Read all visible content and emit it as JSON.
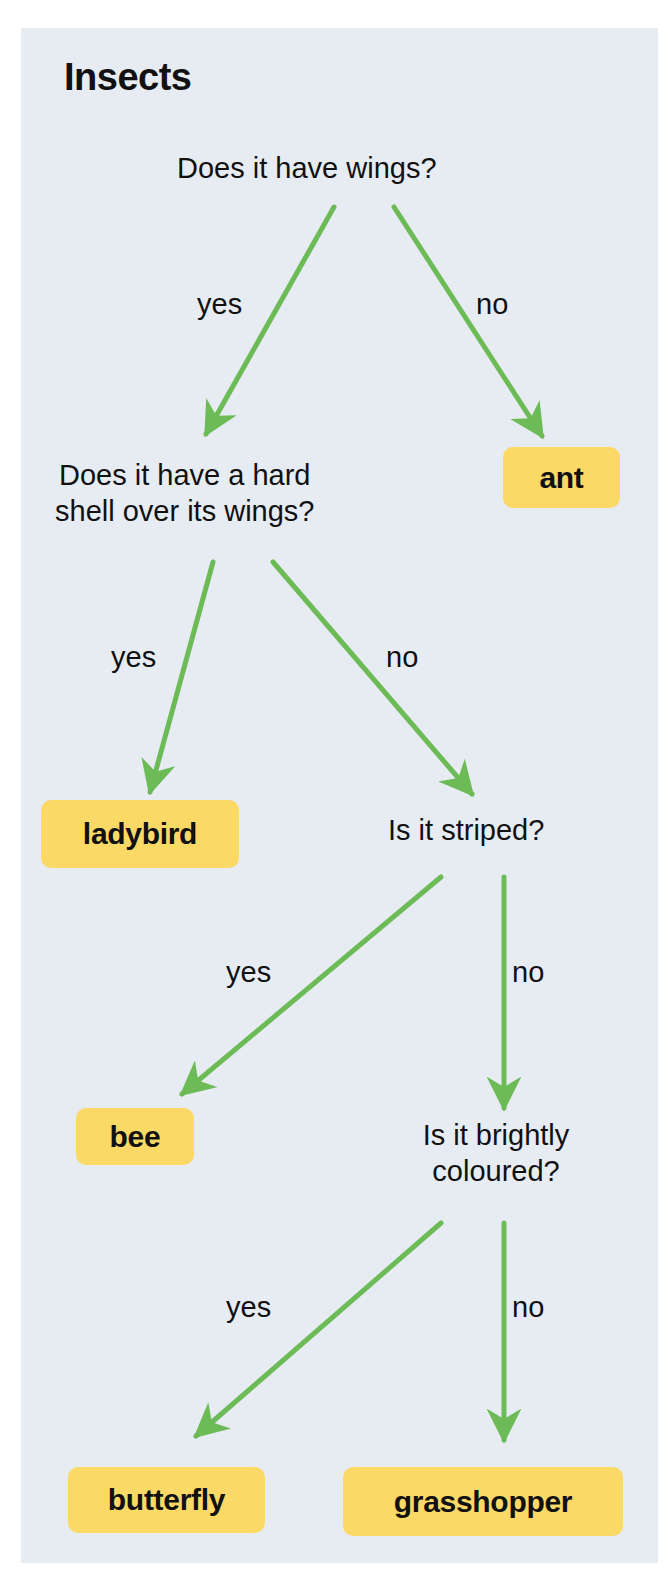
{
  "title": "Insects",
  "colors": {
    "panel": "#e7ecf3",
    "arrow": "#6cbb56",
    "answer_box": "#fbd966",
    "text": "#111111"
  },
  "questions": {
    "q1": "Does it have wings?",
    "q2_line1": "Does it have a hard",
    "q2_line2": "shell over its wings?",
    "q3": "Is it striped?",
    "q4_line1": "Is it brightly",
    "q4_line2": "coloured?"
  },
  "branch_labels": {
    "q1_yes": "yes",
    "q1_no": "no",
    "q2_yes": "yes",
    "q2_no": "no",
    "q3_yes": "yes",
    "q3_no": "no",
    "q4_yes": "yes",
    "q4_no": "no"
  },
  "answers": {
    "ant": "ant",
    "ladybird": "ladybird",
    "bee": "bee",
    "butterfly": "butterfly",
    "grasshopper": "grasshopper"
  },
  "tree": {
    "question": "Does it have wings?",
    "yes": {
      "question": "Does it have a hard shell over its wings?",
      "yes": "ladybird",
      "no": {
        "question": "Is it striped?",
        "yes": "bee",
        "no": {
          "question": "Is it brightly coloured?",
          "yes": "butterfly",
          "no": "grasshopper"
        }
      }
    },
    "no": "ant"
  }
}
